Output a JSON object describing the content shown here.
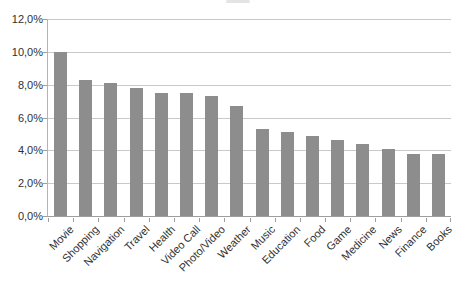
{
  "chart_data": {
    "type": "bar",
    "title": "",
    "xlabel": "",
    "ylabel": "",
    "categories": [
      "Movie",
      "Shopping",
      "Navigation",
      "Travel",
      "Health",
      "Video Call",
      "Photo/Video",
      "Weather",
      "Music",
      "Education",
      "Food",
      "Game",
      "Medicine",
      "News",
      "Finance",
      "Books"
    ],
    "values": [
      10.0,
      8.3,
      8.1,
      7.8,
      7.5,
      7.5,
      7.3,
      6.7,
      5.3,
      5.1,
      4.9,
      4.6,
      4.4,
      4.1,
      3.8,
      3.8
    ],
    "ylim": [
      0,
      12
    ],
    "ytick_step": 2,
    "ytick_labels": [
      "0,0%",
      "2,0%",
      "4,0%",
      "6,0%",
      "8,0%",
      "10,0%",
      "12,0%"
    ],
    "grid": true,
    "legend": false,
    "x_label_rotation_deg": 45,
    "bar_color": "#8d8d8d",
    "gridline_color": "#c9c9c9",
    "axis_color": "#9e9e9e",
    "text_color": "#303030",
    "background_color": "#ffffff"
  }
}
